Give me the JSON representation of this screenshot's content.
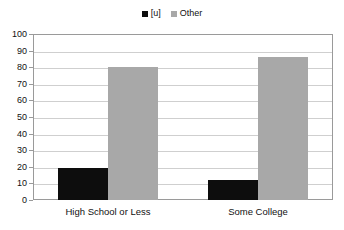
{
  "chart_data": {
    "type": "bar",
    "title": "",
    "subtitle": "",
    "xlabel": "",
    "ylabel": "",
    "categories": [
      "High School or Less",
      "Some College"
    ],
    "series": [
      {
        "name": "[u]",
        "color": "#0d0d0d",
        "values": [
          19,
          12
        ]
      },
      {
        "name": "Other",
        "color": "#a8a8a8",
        "values": [
          80,
          86
        ]
      }
    ],
    "ylim": [
      0,
      100
    ],
    "ytick_step": 10,
    "yticks": [
      0,
      10,
      20,
      30,
      40,
      50,
      60,
      70,
      80,
      90,
      100
    ],
    "ytick_labels": [
      "0",
      "10",
      "20",
      "30",
      "40",
      "50",
      "60",
      "70",
      "80",
      "90",
      "100"
    ],
    "grid": true,
    "grid_axis": "y",
    "legend": true,
    "legend_position": "top-center",
    "grid_color": "#cfcfcf",
    "frame_color": "#9a9a9a",
    "background": "#ffffff"
  },
  "legend": {
    "entries": [
      {
        "label": "[u]",
        "swatch": "legend-swatch-u",
        "color": "#0d0d0d"
      },
      {
        "label": "Other",
        "swatch": "legend-swatch-other",
        "color": "#a8a8a8"
      }
    ]
  }
}
